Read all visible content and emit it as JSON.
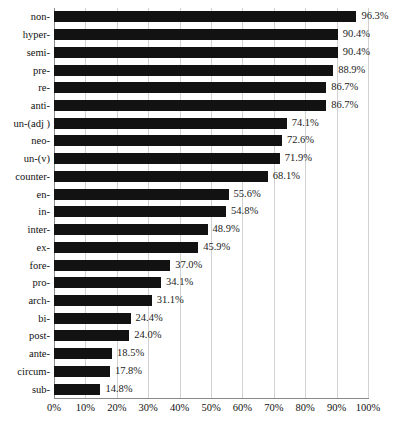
{
  "chart_data": {
    "type": "bar",
    "orientation": "horizontal",
    "title": "",
    "subtitle": "",
    "xlabel": "",
    "ylabel": "",
    "xlim": [
      0,
      100
    ],
    "xticks": [
      "0%",
      "10%",
      "20%",
      "30%",
      "40%",
      "50%",
      "60%",
      "70%",
      "80%",
      "90%",
      "100%"
    ],
    "xtick_values": [
      0,
      10,
      20,
      30,
      40,
      50,
      60,
      70,
      80,
      90,
      100
    ],
    "grid": "vertical",
    "legend": "none",
    "value_label_suffix": "%",
    "bar_color": "#121212",
    "gridline_color": "#d2d2d2",
    "axis_color": "#8a8a8a",
    "background_color": "#ffffff",
    "categories": [
      "non-",
      "hyper-",
      "semi-",
      "pre-",
      "re-",
      "anti-",
      "un-(adj )",
      "neo-",
      "un-(v)",
      "counter-",
      "en-",
      "in-",
      "inter-",
      "ex-",
      "fore-",
      "pro-",
      "arch-",
      "bi-",
      "post-",
      "ante-",
      "circum-",
      "sub-"
    ],
    "values": [
      96.3,
      90.4,
      90.4,
      88.9,
      86.7,
      86.7,
      74.1,
      72.6,
      71.9,
      68.1,
      55.6,
      54.8,
      48.9,
      45.9,
      37.0,
      34.1,
      31.1,
      24.4,
      24.0,
      18.5,
      17.8,
      14.8
    ],
    "data_labels": [
      "96.3%",
      "90.4%",
      "90.4%",
      "88.9%",
      "86.7%",
      "86.7%",
      "74.1%",
      "72.6%",
      "71.9%",
      "68.1%",
      "55.6%",
      "54.8%",
      "48.9%",
      "45.9%",
      "37.0%",
      "34.1%",
      "31.1%",
      "24.4%",
      "24.0%",
      "18.5%",
      "17.8%",
      "14.8%"
    ]
  },
  "caption": {
    "text": "",
    "visible": false
  }
}
